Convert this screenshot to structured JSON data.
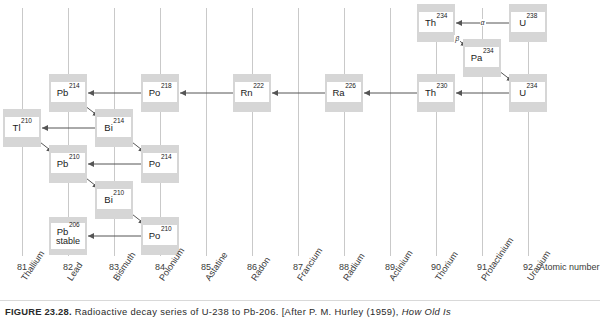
{
  "figure": {
    "caption_label": "FIGURE 23.28.",
    "caption_text": " Radioactive decay series of U-238 to Pb-206. [After P. M. Hurley (1959), ",
    "caption_italic": "How Old Is"
  },
  "axis": {
    "title": "Atomic number",
    "columns": [
      {
        "z": "81",
        "name": "Thallium"
      },
      {
        "z": "82",
        "name": "Lead"
      },
      {
        "z": "83",
        "name": "Bismuth"
      },
      {
        "z": "84",
        "name": "Polonium"
      },
      {
        "z": "85",
        "name": "Astatine"
      },
      {
        "z": "86",
        "name": "Radon"
      },
      {
        "z": "87",
        "name": "Francium"
      },
      {
        "z": "88",
        "name": "Radium"
      },
      {
        "z": "89",
        "name": "Actinium"
      },
      {
        "z": "90",
        "name": "Thorium"
      },
      {
        "z": "91",
        "name": "Protactinium"
      },
      {
        "z": "92",
        "name": "Uranium"
      }
    ]
  },
  "chart_data": {
    "type": "diagram",
    "title": "Radioactive decay series of U-238 to Pb-206",
    "xlabel": "Atomic number",
    "xticks": [
      "81",
      "82",
      "83",
      "84",
      "85",
      "86",
      "87",
      "88",
      "89",
      "90",
      "91",
      "92"
    ],
    "grid": true,
    "colors": {
      "box_fill": "#d6d6d6",
      "plate_fill": "#ffffff",
      "gridline": "#c9c9c9",
      "arrow": "#555555",
      "text": "#1a1a1a"
    },
    "nodes": [
      {
        "id": "U238",
        "symbol": "U",
        "mass": "238",
        "z": 92,
        "row": 0,
        "note": ""
      },
      {
        "id": "Th234",
        "symbol": "Th",
        "mass": "234",
        "z": 90,
        "row": 0,
        "note": ""
      },
      {
        "id": "Pa234",
        "symbol": "Pa",
        "mass": "234",
        "z": 91,
        "row": 1,
        "note": ""
      },
      {
        "id": "U234",
        "symbol": "U",
        "mass": "234",
        "z": 92,
        "row": 2,
        "note": ""
      },
      {
        "id": "Th230",
        "symbol": "Th",
        "mass": "230",
        "z": 90,
        "row": 2,
        "note": ""
      },
      {
        "id": "Ra226",
        "symbol": "Ra",
        "mass": "226",
        "z": 88,
        "row": 2,
        "note": ""
      },
      {
        "id": "Rn222",
        "symbol": "Rn",
        "mass": "222",
        "z": 86,
        "row": 2,
        "note": ""
      },
      {
        "id": "Po218",
        "symbol": "Po",
        "mass": "218",
        "z": 84,
        "row": 2,
        "note": ""
      },
      {
        "id": "Pb214",
        "symbol": "Pb",
        "mass": "214",
        "z": 82,
        "row": 2,
        "note": ""
      },
      {
        "id": "Bi214",
        "symbol": "Bi",
        "mass": "214",
        "z": 83,
        "row": 3,
        "note": ""
      },
      {
        "id": "Tl210",
        "symbol": "Tl",
        "mass": "210",
        "z": 81,
        "row": 3,
        "note": ""
      },
      {
        "id": "Po214",
        "symbol": "Po",
        "mass": "214",
        "z": 84,
        "row": 4,
        "note": ""
      },
      {
        "id": "Pb210",
        "symbol": "Pb",
        "mass": "210",
        "z": 82,
        "row": 4,
        "note": ""
      },
      {
        "id": "Bi210",
        "symbol": "Bi",
        "mass": "210",
        "z": 83,
        "row": 5,
        "note": ""
      },
      {
        "id": "Po210",
        "symbol": "Po",
        "mass": "210",
        "z": 84,
        "row": 6,
        "note": ""
      },
      {
        "id": "Pb206",
        "symbol": "Pb",
        "mass": "206",
        "z": 82,
        "row": 6,
        "note": "stable"
      }
    ],
    "edges": [
      {
        "from": "U238",
        "to": "Th234",
        "label": "α"
      },
      {
        "from": "Th234",
        "to": "Pa234",
        "label": "β"
      },
      {
        "from": "Pa234",
        "to": "U234",
        "label": ""
      },
      {
        "from": "U234",
        "to": "Th230",
        "label": ""
      },
      {
        "from": "Th230",
        "to": "Ra226",
        "label": ""
      },
      {
        "from": "Ra226",
        "to": "Rn222",
        "label": ""
      },
      {
        "from": "Rn222",
        "to": "Po218",
        "label": ""
      },
      {
        "from": "Po218",
        "to": "Pb214",
        "label": ""
      },
      {
        "from": "Pb214",
        "to": "Bi214",
        "label": ""
      },
      {
        "from": "Bi214",
        "to": "Tl210",
        "label": ""
      },
      {
        "from": "Bi214",
        "to": "Po214",
        "label": ""
      },
      {
        "from": "Tl210",
        "to": "Pb210",
        "label": ""
      },
      {
        "from": "Po214",
        "to": "Pb210",
        "label": ""
      },
      {
        "from": "Pb210",
        "to": "Bi210",
        "label": ""
      },
      {
        "from": "Bi210",
        "to": "Po210",
        "label": ""
      },
      {
        "from": "Po210",
        "to": "Pb206",
        "label": ""
      }
    ]
  }
}
